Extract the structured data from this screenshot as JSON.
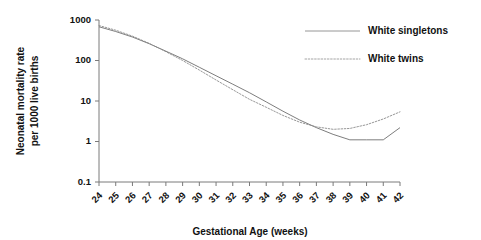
{
  "chart_data": {
    "type": "line",
    "title": "",
    "xlabel": "Gestational Age (weeks)",
    "ylabel_line1": "Neonatal mortality rate",
    "ylabel_line2": "per 1000 live births",
    "x": [
      24,
      25,
      26,
      27,
      28,
      29,
      30,
      31,
      32,
      33,
      34,
      35,
      36,
      37,
      38,
      39,
      40,
      41,
      42
    ],
    "xlim": [
      24,
      42
    ],
    "xticks": [
      "24",
      "25",
      "26",
      "27",
      "28",
      "29",
      "30",
      "31",
      "32",
      "33",
      "34",
      "35",
      "36",
      "37",
      "38",
      "39",
      "40",
      "41",
      "42"
    ],
    "yscale": "log",
    "ylim": [
      0.1,
      1000
    ],
    "yticks": [
      "1000",
      "100",
      "10",
      "1",
      "0.1"
    ],
    "ytick_values": [
      1000,
      100,
      10,
      1,
      0.1
    ],
    "grid": false,
    "legend_position": "top-right",
    "series": [
      {
        "name": "White singletons",
        "style": "solid",
        "color": "#6e6e6e",
        "values": [
          680,
          520,
          380,
          260,
          170,
          110,
          68,
          42,
          26,
          16,
          9.5,
          5.6,
          3.4,
          2.2,
          1.5,
          1.1,
          1.1,
          1.1,
          2.2
        ]
      },
      {
        "name": "White twins",
        "style": "dotted",
        "color": "#8c8c8c",
        "values": [
          730,
          560,
          400,
          265,
          165,
          100,
          58,
          33,
          19,
          11,
          7.0,
          4.4,
          3.0,
          2.3,
          2.0,
          2.1,
          2.6,
          3.6,
          5.4
        ]
      }
    ]
  },
  "legend": {
    "items": [
      {
        "label": "White singletons",
        "style": "solid"
      },
      {
        "label": "White twins",
        "style": "dotted"
      }
    ]
  }
}
